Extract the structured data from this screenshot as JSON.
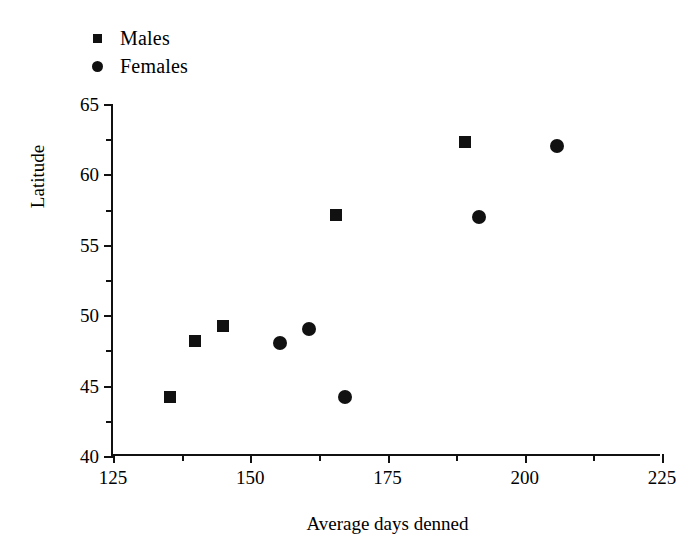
{
  "chart_data": {
    "type": "scatter",
    "title": "",
    "xlabel": "Average days denned",
    "ylabel": "Latitude",
    "xlim": [
      125,
      225
    ],
    "ylim": [
      40,
      65
    ],
    "xticks": [
      125,
      150,
      175,
      200,
      225
    ],
    "xticks_minor": [
      137.5,
      162.5,
      187.5,
      212.5
    ],
    "yticks": [
      40,
      45,
      50,
      55,
      60,
      65
    ],
    "yticks_minor": [
      42.5,
      47.5,
      52.5,
      57.5,
      62.5
    ],
    "grid": false,
    "legend_position": "top-left",
    "series": [
      {
        "name": "Males",
        "marker": "square",
        "color": "#111111",
        "points": [
          {
            "x": 135.4,
            "y": 44.2
          },
          {
            "x": 140.0,
            "y": 48.2
          },
          {
            "x": 145.0,
            "y": 49.2
          },
          {
            "x": 165.6,
            "y": 57.1
          },
          {
            "x": 189.1,
            "y": 62.3
          }
        ]
      },
      {
        "name": "Females",
        "marker": "circle",
        "color": "#111111",
        "points": [
          {
            "x": 155.4,
            "y": 48.0
          },
          {
            "x": 160.7,
            "y": 49.0
          },
          {
            "x": 167.3,
            "y": 44.2
          },
          {
            "x": 191.7,
            "y": 57.0
          },
          {
            "x": 205.9,
            "y": 62.0
          }
        ]
      }
    ]
  },
  "legend": {
    "items": [
      {
        "label": "Males",
        "marker": "square"
      },
      {
        "label": "Females",
        "marker": "circle"
      }
    ]
  },
  "axes": {
    "x_title": "Average days denned",
    "y_title": "Latitude",
    "x_tick_labels": [
      "125",
      "150",
      "175",
      "200",
      "225"
    ],
    "y_tick_labels": [
      "40",
      "45",
      "50",
      "55",
      "60",
      "65"
    ]
  },
  "colors": {
    "marker": "#111111",
    "axis": "#111111",
    "background": "#ffffff"
  }
}
